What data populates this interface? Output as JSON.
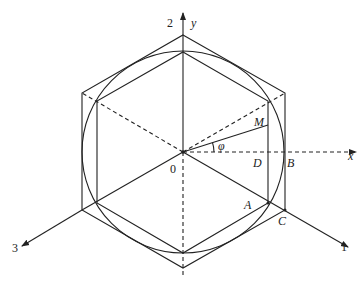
{
  "diagram": {
    "type": "geometry",
    "stroke_color": "#222222",
    "origin_label": "0",
    "axes": {
      "axis1": "1",
      "axis2": "2",
      "axis3": "3",
      "x": "x",
      "y": "y"
    },
    "points": {
      "M": "M",
      "D": "D",
      "B": "B",
      "A": "A",
      "C": "C"
    },
    "angle_label": "φ"
  }
}
